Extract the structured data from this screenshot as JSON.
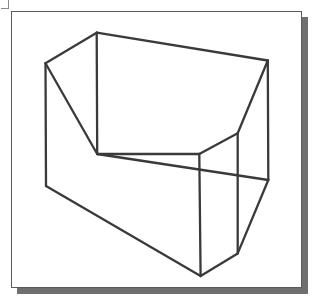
{
  "page": {
    "width": 319,
    "height": 301,
    "background_color": "#ffffff"
  },
  "plate": {
    "x": 11,
    "y": 11,
    "width": 291,
    "height": 277,
    "fill_color": "#ffffff",
    "border_color": "#5b5b5b",
    "border_width": 1,
    "shadow_color": "#706f6f",
    "shadow_offset_x": 6,
    "shadow_offset_y": 6
  },
  "corner_tick": {
    "color": "#8d8d8d"
  },
  "figure": {
    "name": "prism-wireframe",
    "stroke_color": "#3a3a3a",
    "stroke_width": 2.3,
    "vertices": {
      "top_left_apex": [
        96.7,
        32.7
      ],
      "top_right": [
        267.8,
        60.5
      ],
      "left_upper": [
        45.5,
        63.2
      ],
      "left_lower": [
        46.0,
        186.0
      ],
      "mid_upper": [
        97.2,
        154.0
      ],
      "v_apex": [
        199.3,
        154.0
      ],
      "v_right_top": [
        237.7,
        133.3
      ],
      "right_mid": [
        268.3,
        180.0
      ],
      "mid_cross_left": [
        199.6,
        175.2
      ],
      "right_lower": [
        237.7,
        253.4
      ],
      "bottom_apex": [
        200.6,
        276.0
      ]
    },
    "edges": [
      {
        "name": "top-edge",
        "from": "top_left_apex",
        "to": "top_right"
      },
      {
        "name": "top-left-slant",
        "from": "top_left_apex",
        "to": "left_upper"
      },
      {
        "name": "left-vertical",
        "from": "left_upper",
        "to": "left_lower"
      },
      {
        "name": "left-inner-slant",
        "from": "left_upper",
        "to": "mid_upper"
      },
      {
        "name": "front-left-vertical",
        "from": "top_left_apex",
        "to": "mid_upper"
      },
      {
        "name": "mid-slant-to-v",
        "from": "mid_upper",
        "to": "v_apex"
      },
      {
        "name": "v-right-slant",
        "from": "v_apex",
        "to": "v_right_top"
      },
      {
        "name": "right-upper-slant",
        "from": "top_right",
        "to": "v_right_top"
      },
      {
        "name": "right-outer-vertical",
        "from": "top_right",
        "to": "right_mid"
      },
      {
        "name": "right-inner-vertical",
        "from": "v_right_top",
        "to": "right_lower"
      },
      {
        "name": "cross-line",
        "from": "mid_upper",
        "to": "right_mid"
      },
      {
        "name": "center-vertical",
        "from": "v_apex",
        "to": "bottom_apex"
      },
      {
        "name": "bottom-left-slant",
        "from": "left_lower",
        "to": "bottom_apex"
      },
      {
        "name": "bottom-right-slant",
        "from": "bottom_apex",
        "to": "right_lower"
      },
      {
        "name": "right-lower-slant",
        "from": "right_mid",
        "to": "right_lower"
      }
    ]
  }
}
